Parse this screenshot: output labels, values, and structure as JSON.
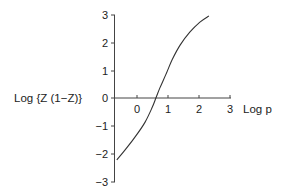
{
  "chart_data": {
    "type": "line",
    "title": "",
    "xlabel": "Log p",
    "ylabel": "Log {Z (1−Z)}",
    "xlim": [
      -0.7,
      3
    ],
    "ylim": [
      -3,
      3
    ],
    "x_ticks": [
      "0",
      "1",
      "2",
      "3"
    ],
    "y_ticks": [
      "3",
      "2",
      "1",
      "0",
      "−1",
      "−2",
      "−3"
    ],
    "grid": false,
    "legend": null,
    "series": [
      {
        "name": "Log {Z (1−Z)} vs Log p",
        "x": [
          -0.65,
          -0.39,
          -0.06,
          0.26,
          0.48,
          0.61,
          0.74,
          0.94,
          1.13,
          1.39,
          1.71,
          2.03,
          2.32
        ],
        "y": [
          -2.21,
          -1.86,
          -1.39,
          -0.86,
          -0.36,
          0.0,
          0.36,
          0.86,
          1.36,
          1.89,
          2.36,
          2.71,
          2.93
        ]
      }
    ]
  },
  "labels": {
    "ylabel": "Log {Z (1−Z)}",
    "xlabel": "Log p",
    "xticks": [
      "0",
      "1",
      "2",
      "3"
    ],
    "yticks": [
      "3",
      "2",
      "1",
      "0",
      "−1",
      "−2",
      "−3"
    ]
  },
  "colors": {
    "line": "#333333",
    "axis": "#444444"
  }
}
